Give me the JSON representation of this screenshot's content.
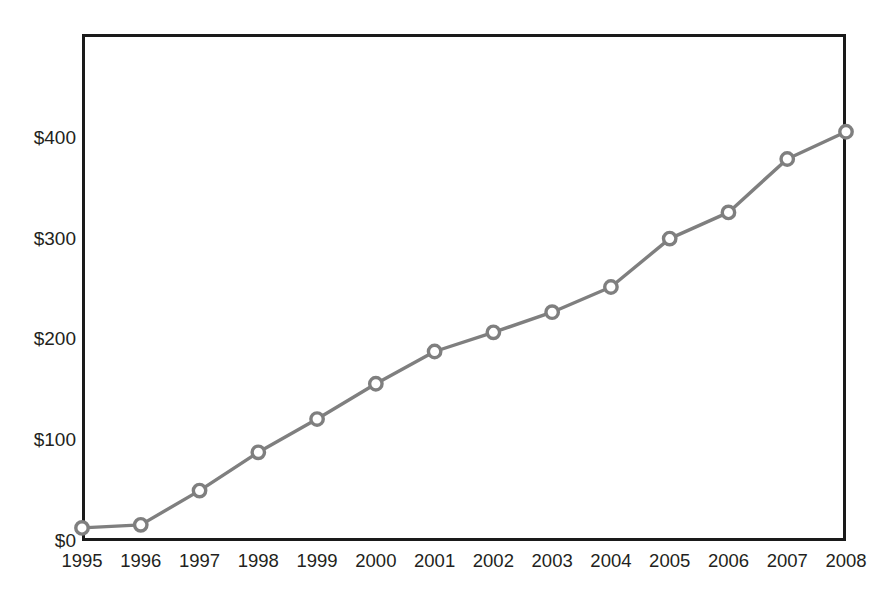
{
  "chart_data": {
    "type": "line",
    "title": "",
    "subtitle": "",
    "xlabel": "",
    "ylabel": "",
    "categories": [
      "1995",
      "1996",
      "1997",
      "1998",
      "1999",
      "2000",
      "2001",
      "2002",
      "2003",
      "2004",
      "2005",
      "2006",
      "2007",
      "2008"
    ],
    "x": [
      1995,
      1996,
      1997,
      1998,
      1999,
      2000,
      2001,
      2002,
      2003,
      2004,
      2005,
      2006,
      2007,
      2008
    ],
    "values": [
      13,
      16,
      50,
      88,
      121,
      156,
      188,
      207,
      227,
      252,
      300,
      326,
      379,
      406
    ],
    "series": [
      {
        "name": "",
        "values": [
          13,
          16,
          50,
          88,
          121,
          156,
          188,
          207,
          227,
          252,
          300,
          326,
          379,
          406
        ],
        "line_color": "#7f7f7f",
        "marker": "circle-open",
        "marker_color": "#7f7f7f",
        "marker_fill": "#ffffff"
      }
    ],
    "ylim": [
      0,
      503
    ],
    "xlim": [
      1995,
      2008
    ],
    "ytick_labels": [
      "$0",
      "$100",
      "$200",
      "$300",
      "$400"
    ],
    "ytick_values": [
      0,
      100,
      200,
      300,
      400
    ],
    "xtick_labels": [
      "1995",
      "1996",
      "1997",
      "1998",
      "1999",
      "2000",
      "2001",
      "2002",
      "2003",
      "2004",
      "2005",
      "2006",
      "2007",
      "2008"
    ],
    "grid": true,
    "grid_color": "#d9d9d9",
    "axis_color": "#1a1a1a",
    "legend": null,
    "legend_position": "none",
    "annotations": [],
    "background": "#ffffff",
    "value_prefix": "$"
  }
}
